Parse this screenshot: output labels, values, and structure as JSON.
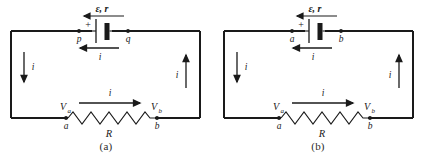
{
  "figure": {
    "type": "circuit-diagram-pair",
    "line_color": "#1a1a1a",
    "background_color": "#ffffff"
  },
  "panels": [
    {
      "caption": "(a)",
      "source_label": "ε, r",
      "emf_symbol": "ε",
      "internal_resistance": "r",
      "polarity_plus": "+",
      "battery_branch_current": "i",
      "left_branch_current": "i",
      "left_branch_direction": "down",
      "right_branch_current": "i",
      "right_branch_direction": "up",
      "resistor_current": "i",
      "resistor_current_direction": "right",
      "resistor_label": "R",
      "top_node_left": "p",
      "top_node_right": "q",
      "bottom_node_left": "a",
      "bottom_node_right": "b",
      "potential_left": "V",
      "potential_left_sub": "a",
      "potential_right": "V",
      "potential_right_sub": "b"
    },
    {
      "caption": "(b)",
      "source_label": "ε, r",
      "emf_symbol": "ε",
      "internal_resistance": "r",
      "polarity_plus": "+",
      "battery_branch_current": "i",
      "left_branch_current": "i",
      "left_branch_direction": "down",
      "right_branch_current": "i",
      "right_branch_direction": "up",
      "resistor_current": "i",
      "resistor_current_direction": "right",
      "resistor_label": "R",
      "top_node_left": "a",
      "top_node_right": "b",
      "bottom_node_left": "a",
      "bottom_node_right": "b",
      "potential_left": "V",
      "potential_left_sub": "a",
      "potential_right": "V",
      "potential_right_sub": "b"
    }
  ]
}
